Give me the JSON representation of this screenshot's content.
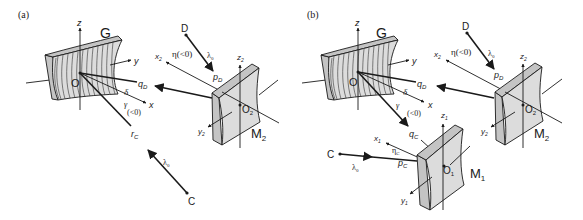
{
  "figure": {
    "panels": [
      {
        "id": "a",
        "label": "(a)",
        "grating_label": "G",
        "origin_label": "O",
        "axes": {
          "z": "z",
          "y": "y",
          "x": "x"
        },
        "mirror": {
          "label": "M",
          "sub": "2",
          "origin": "O",
          "origin_sub": "2",
          "z": "z",
          "z_sub": "2",
          "x": "x",
          "x_sub": "2",
          "y": "y",
          "y_sub": "2"
        },
        "points": {
          "D": "D",
          "C": "C"
        },
        "rays": {
          "pD": "p",
          "pD_sub": "D",
          "qD": "q",
          "qD_sub": "D",
          "rC": "r",
          "rC_sub": "C"
        },
        "wavelength": "λ",
        "wavelength_sub": "0",
        "angles": {
          "eta": "η(<0)",
          "delta": "δ",
          "gamma": "γ",
          "gamma_note": "(<0)"
        }
      },
      {
        "id": "b",
        "label": "(b)",
        "grating_label": "G",
        "origin_label": "O",
        "axes": {
          "z": "z",
          "y": "y",
          "x": "x"
        },
        "mirror2": {
          "label": "M",
          "sub": "2",
          "origin": "O",
          "origin_sub": "2",
          "z": "z",
          "z_sub": "2",
          "x": "x",
          "x_sub": "2",
          "y": "y",
          "y_sub": "2"
        },
        "mirror1": {
          "label": "M",
          "sub": "1",
          "origin": "O",
          "origin_sub": "1",
          "z": "z",
          "z_sub": "1",
          "x": "x",
          "x_sub": "1",
          "y": "y",
          "y_sub": "1"
        },
        "points": {
          "D": "D",
          "C": "C"
        },
        "rays": {
          "pD": "p",
          "pD_sub": "D",
          "qD": "q",
          "qD_sub": "D",
          "qC": "q",
          "qC_sub": "C",
          "pC": "p",
          "pC_sub": "C"
        },
        "wavelength": "λ",
        "wavelength_sub": "0",
        "angles": {
          "eta": "η(<0)",
          "etaC": "η",
          "etaC_sub": "C",
          "delta": "δ",
          "gamma": "γ",
          "gamma_note": "(<0)"
        }
      }
    ]
  }
}
